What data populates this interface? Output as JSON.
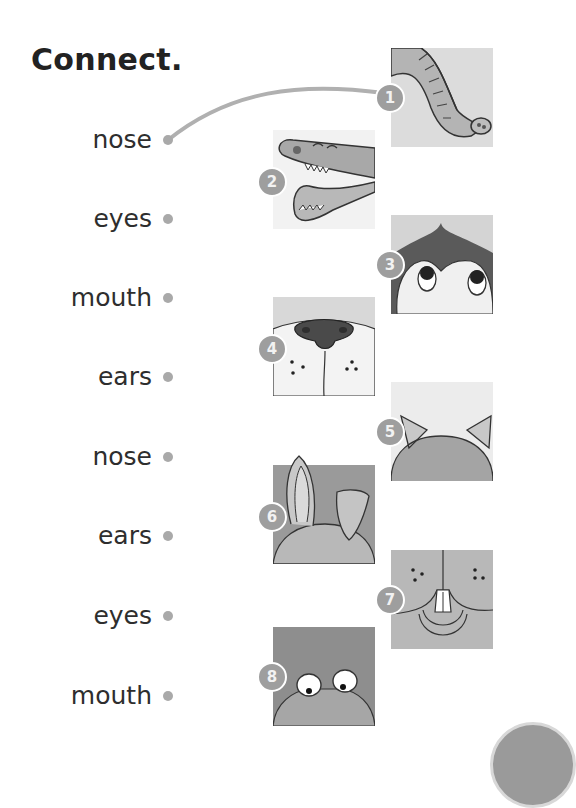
{
  "title": "Connect.",
  "words": [
    {
      "label": "nose",
      "top": 127,
      "dot_y": 140
    },
    {
      "label": "eyes",
      "top": 206,
      "dot_y": 219
    },
    {
      "label": "mouth",
      "top": 285,
      "dot_y": 298
    },
    {
      "label": "ears",
      "top": 364,
      "dot_y": 377
    },
    {
      "label": "nose",
      "top": 444,
      "dot_y": 457
    },
    {
      "label": "ears",
      "top": 523,
      "dot_y": 536
    },
    {
      "label": "eyes",
      "top": 603,
      "dot_y": 616
    },
    {
      "label": "mouth",
      "top": 683,
      "dot_y": 696
    }
  ],
  "pictures": [
    {
      "number": "1",
      "subject": "elephant-trunk"
    },
    {
      "number": "2",
      "subject": "crocodile-mouth"
    },
    {
      "number": "3",
      "subject": "penguin-eyes"
    },
    {
      "number": "4",
      "subject": "dog-nose"
    },
    {
      "number": "5",
      "subject": "cat-ears"
    },
    {
      "number": "6",
      "subject": "rabbit-ears"
    },
    {
      "number": "7",
      "subject": "rabbit-mouth"
    },
    {
      "number": "8",
      "subject": "frog-eyes"
    }
  ],
  "example_connection": {
    "from_word": "nose",
    "to_picture": "1"
  },
  "colors": {
    "line": "#b0b0b0",
    "dot": "#a9a9a9",
    "badge": "#9e9e9e",
    "text": "#2e2e2e"
  }
}
